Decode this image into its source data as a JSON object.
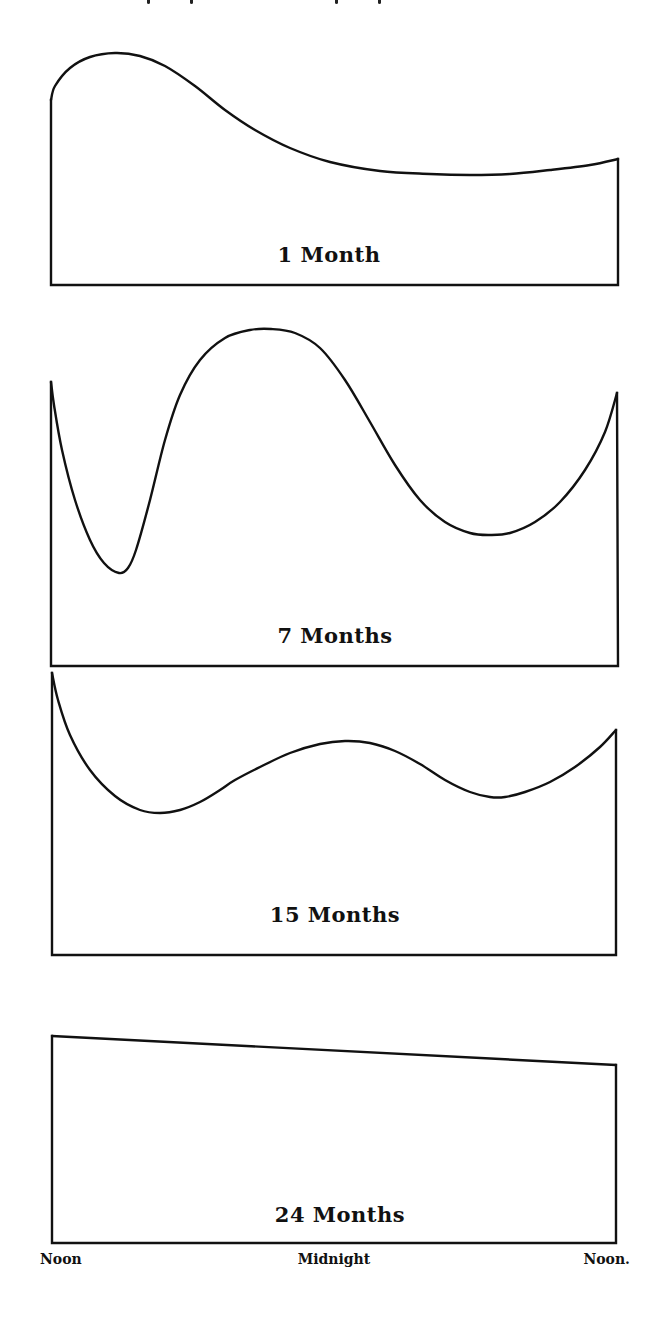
{
  "figure": {
    "panels": [
      {
        "label": "1 Month"
      },
      {
        "label": "7 Months"
      },
      {
        "label": "15 Months"
      },
      {
        "label": "24 Months"
      }
    ],
    "x_axis": {
      "labels": [
        "Noon",
        "Midnight",
        "Noon."
      ]
    },
    "colors": {
      "ink": "#111111",
      "background": "#ffffff"
    }
  },
  "chart_data": [
    {
      "type": "area",
      "title": "1 Month",
      "xlabel": "",
      "ylabel": "",
      "x_ticks": [
        "Noon",
        "Midnight",
        "Noon"
      ],
      "x": [
        0,
        1,
        2,
        3,
        4,
        5,
        6,
        7,
        8,
        9,
        10,
        11,
        12,
        13,
        14,
        15,
        16,
        17,
        18,
        19,
        20,
        21,
        22,
        23,
        24
      ],
      "values": [
        0.77,
        0.92,
        0.98,
        0.96,
        0.88,
        0.77,
        0.66,
        0.56,
        0.48,
        0.41,
        0.36,
        0.32,
        0.29,
        0.27,
        0.25,
        0.24,
        0.24,
        0.23,
        0.23,
        0.24,
        0.24,
        0.25,
        0.26,
        0.28,
        0.3
      ],
      "ylim": [
        0,
        1
      ],
      "grid": false,
      "legend": false,
      "px": {
        "x0": 51,
        "x1": 618,
        "base": 285,
        "top": 53,
        "path": [
          [
            51,
            100
          ],
          [
            55,
            86
          ],
          [
            70,
            68
          ],
          [
            90,
            57
          ],
          [
            115,
            53
          ],
          [
            140,
            56
          ],
          [
            165,
            66
          ],
          [
            195,
            86
          ],
          [
            225,
            110
          ],
          [
            255,
            130
          ],
          [
            290,
            148
          ],
          [
            330,
            162
          ],
          [
            380,
            171
          ],
          [
            430,
            174
          ],
          [
            470,
            175
          ],
          [
            510,
            174
          ],
          [
            550,
            170
          ],
          [
            590,
            165
          ],
          [
            618,
            159
          ]
        ]
      },
      "label_pos": [
        329,
        262
      ]
    },
    {
      "type": "area",
      "title": "7 Months",
      "xlabel": "",
      "ylabel": "",
      "x_ticks": [
        "Noon",
        "Midnight",
        "Noon"
      ],
      "x": [
        0,
        1,
        2,
        3,
        4,
        5,
        6,
        7,
        8,
        9,
        10,
        11,
        12,
        13,
        14,
        15,
        16,
        17,
        18,
        19,
        20,
        21,
        22,
        23,
        24
      ],
      "values": [
        0.84,
        0.48,
        0.28,
        0.28,
        0.5,
        0.76,
        0.91,
        0.98,
        1.0,
        0.96,
        0.86,
        0.73,
        0.6,
        0.49,
        0.42,
        0.39,
        0.38,
        0.4,
        0.45,
        0.52,
        0.6,
        0.68,
        0.74,
        0.78,
        0.8
      ],
      "ylim": [
        0,
        1
      ],
      "grid": false,
      "legend": false,
      "px": {
        "x0": 51,
        "x1": 618,
        "base": 666,
        "top": 329,
        "path": [
          [
            51,
            382
          ],
          [
            54,
            405
          ],
          [
            62,
            450
          ],
          [
            75,
            500
          ],
          [
            90,
            540
          ],
          [
            104,
            563
          ],
          [
            119,
            573
          ],
          [
            128,
            568
          ],
          [
            136,
            550
          ],
          [
            150,
            500
          ],
          [
            165,
            440
          ],
          [
            180,
            395
          ],
          [
            200,
            360
          ],
          [
            225,
            338
          ],
          [
            250,
            330
          ],
          [
            271,
            329
          ],
          [
            295,
            333
          ],
          [
            320,
            348
          ],
          [
            345,
            380
          ],
          [
            370,
            422
          ],
          [
            395,
            465
          ],
          [
            420,
            500
          ],
          [
            445,
            522
          ],
          [
            470,
            533
          ],
          [
            490,
            535
          ],
          [
            510,
            533
          ],
          [
            535,
            522
          ],
          [
            560,
            502
          ],
          [
            585,
            470
          ],
          [
            605,
            432
          ],
          [
            617,
            393
          ]
        ]
      },
      "label_pos": [
        335,
        643
      ]
    },
    {
      "type": "area",
      "title": "15 Months",
      "xlabel": "",
      "ylabel": "",
      "x_ticks": [
        "Noon",
        "Midnight",
        "Noon"
      ],
      "x": [
        0,
        1,
        2,
        3,
        4,
        5,
        6,
        7,
        8,
        9,
        10,
        11,
        12,
        13,
        14,
        15,
        16,
        17,
        18,
        19,
        20,
        21,
        22,
        23,
        24
      ],
      "values": [
        0.97,
        0.76,
        0.6,
        0.5,
        0.46,
        0.47,
        0.53,
        0.6,
        0.65,
        0.68,
        0.69,
        0.68,
        0.65,
        0.6,
        0.55,
        0.52,
        0.52,
        0.55,
        0.62,
        0.71,
        0.8,
        0.84,
        0.86,
        0.86,
        0.86
      ],
      "ylim": [
        0,
        1
      ],
      "grid": false,
      "legend": false,
      "px": {
        "x0": 52,
        "x1": 616,
        "base": 955,
        "top": 673,
        "path": [
          [
            52,
            673
          ],
          [
            58,
            700
          ],
          [
            70,
            735
          ],
          [
            90,
            770
          ],
          [
            115,
            796
          ],
          [
            140,
            810
          ],
          [
            160,
            813
          ],
          [
            180,
            810
          ],
          [
            200,
            802
          ],
          [
            220,
            790
          ],
          [
            235,
            780
          ],
          [
            260,
            767
          ],
          [
            290,
            753
          ],
          [
            320,
            744
          ],
          [
            345,
            741
          ],
          [
            370,
            743
          ],
          [
            395,
            751
          ],
          [
            420,
            764
          ],
          [
            445,
            780
          ],
          [
            470,
            792
          ],
          [
            490,
            797
          ],
          [
            505,
            797
          ],
          [
            525,
            792
          ],
          [
            550,
            782
          ],
          [
            575,
            767
          ],
          [
            600,
            747
          ],
          [
            616,
            730
          ]
        ]
      },
      "label_pos": [
        335,
        922
      ]
    },
    {
      "type": "area",
      "title": "24 Months",
      "xlabel": "",
      "ylabel": "",
      "x_ticks": [
        "Noon",
        "Midnight",
        "Noon"
      ],
      "x": [
        0,
        24
      ],
      "values": [
        0.88,
        0.75
      ],
      "ylim": [
        0,
        1
      ],
      "grid": false,
      "legend": false,
      "px": {
        "x0": 52,
        "x1": 616,
        "base": 1243,
        "top": 1036,
        "path": [
          [
            52,
            1036
          ],
          [
            616,
            1065
          ]
        ]
      },
      "label_pos": [
        340,
        1222
      ]
    }
  ]
}
